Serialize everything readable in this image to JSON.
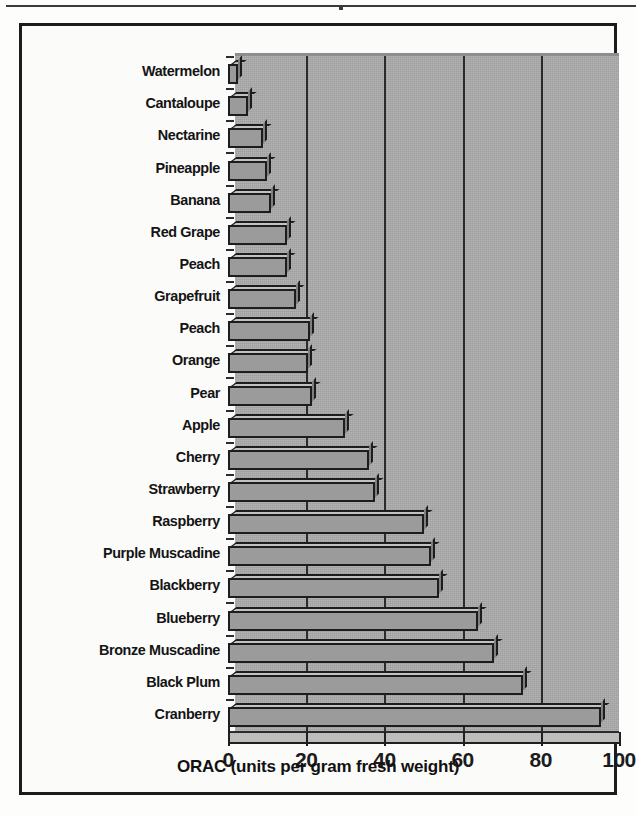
{
  "figure": {
    "axis_title": "ORAC (units per gram fresh weight)"
  },
  "chart_data": {
    "type": "bar",
    "orientation": "horizontal",
    "title": "",
    "xlabel": "ORAC (units per gram fresh weight)",
    "ylabel": "",
    "xlim": [
      0,
      100
    ],
    "xticks": [
      "0",
      "20",
      "40",
      "60",
      "80",
      "100"
    ],
    "xtick_values": [
      0,
      20,
      40,
      60,
      80,
      100
    ],
    "grid": "vertical gridlines at 20, 40, 60, 80",
    "legend": "none",
    "categories": [
      "Watermelon",
      "Cantaloupe",
      "Nectarine",
      "Pineapple",
      "Banana",
      "Red Grape",
      "Peach",
      "Grapefruit",
      "Peach",
      "Orange",
      "Pear",
      "Apple",
      "Cherry",
      "Strawberry",
      "Raspberry",
      "Purple Muscadine",
      "Blackberry",
      "Blueberry",
      "Bronze Muscadine",
      "Black Plum",
      "Cranberry"
    ],
    "values": [
      2.5,
      5,
      9,
      10,
      11,
      15,
      15,
      17.5,
      21,
      20.5,
      21.5,
      30,
      36,
      37.5,
      50,
      52,
      54,
      64,
      68,
      75.5,
      95.5
    ],
    "bar_color": "#9b9b9b",
    "panel_color": "#a9a9a9",
    "outline_color": "#1d1d1d"
  }
}
